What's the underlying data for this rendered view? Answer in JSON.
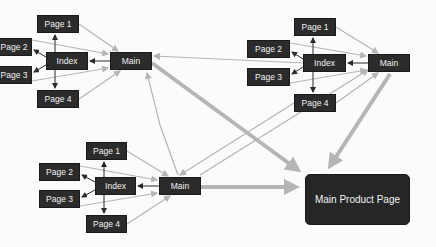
{
  "diagram": {
    "clusters": [
      {
        "id": "top-left",
        "nodes": {
          "page1": {
            "label": "Page 1",
            "x": 37,
            "y": 15,
            "w": 42,
            "h": 18
          },
          "page2": {
            "label": "Page 2",
            "x": -4,
            "y": 38,
            "w": 36,
            "h": 18
          },
          "index": {
            "label": "Index",
            "x": 46,
            "y": 52,
            "w": 42,
            "h": 18
          },
          "main": {
            "label": "Main",
            "x": 110,
            "y": 52,
            "w": 42,
            "h": 18
          },
          "page3": {
            "label": "Page 3",
            "x": -4,
            "y": 66,
            "w": 36,
            "h": 18
          },
          "page4": {
            "label": "Page 4",
            "x": 37,
            "y": 90,
            "w": 42,
            "h": 18
          }
        }
      },
      {
        "id": "top-right",
        "nodes": {
          "page1": {
            "label": "Page 1",
            "x": 294,
            "y": 18,
            "w": 42,
            "h": 18
          },
          "page2": {
            "label": "Page 2",
            "x": 247,
            "y": 40,
            "w": 43,
            "h": 18
          },
          "index": {
            "label": "Index",
            "x": 303,
            "y": 54,
            "w": 43,
            "h": 18
          },
          "main": {
            "label": "Main",
            "x": 368,
            "y": 54,
            "w": 42,
            "h": 18
          },
          "page3": {
            "label": "Page 3",
            "x": 247,
            "y": 68,
            "w": 43,
            "h": 18
          },
          "page4": {
            "label": "Page 4",
            "x": 294,
            "y": 94,
            "w": 42,
            "h": 18
          }
        }
      },
      {
        "id": "bottom",
        "nodes": {
          "page1": {
            "label": "Page 1",
            "x": 86,
            "y": 142,
            "w": 41,
            "h": 18
          },
          "page2": {
            "label": "Page 2",
            "x": 39,
            "y": 163,
            "w": 41,
            "h": 18
          },
          "index": {
            "label": "Index",
            "x": 95,
            "y": 177,
            "w": 41,
            "h": 18
          },
          "main": {
            "label": "Main",
            "x": 159,
            "y": 177,
            "w": 42,
            "h": 18
          },
          "page3": {
            "label": "Page 3",
            "x": 39,
            "y": 190,
            "w": 41,
            "h": 18
          },
          "page4": {
            "label": "Page 4",
            "x": 86,
            "y": 215,
            "w": 41,
            "h": 18
          }
        }
      }
    ],
    "target": {
      "label": "Main Product Page",
      "x": 305,
      "y": 174,
      "w": 105,
      "h": 51
    },
    "colors": {
      "node_fill": "#2b2b2b",
      "node_text": "#f2f2f2",
      "edge_light": "#b5b5b5",
      "edge_dark": "#2b2b2b",
      "background": "#fbfbfb"
    }
  }
}
